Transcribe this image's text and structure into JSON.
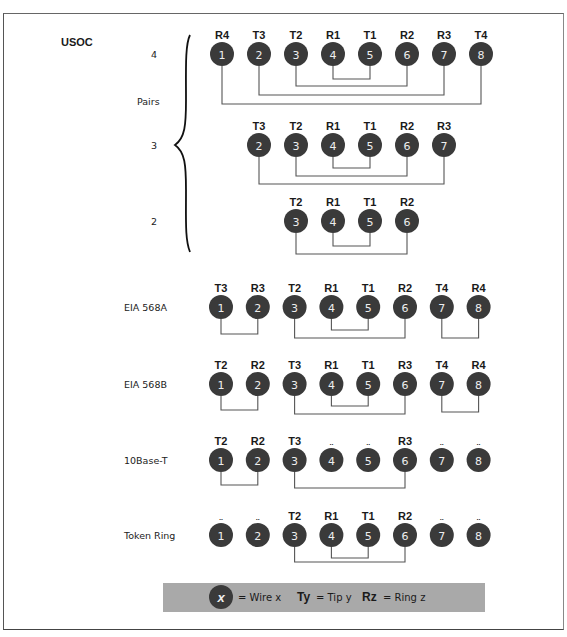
{
  "title": "USOC",
  "usoc_group": {
    "pairs_label": "Pairs",
    "pair_counts": [
      "4",
      "3",
      "2"
    ]
  },
  "pin_color": "#3a3a3a",
  "pin_text_color": "#eeeeee",
  "wire_color": "#555555",
  "legend_bg": "#a9a9a9",
  "unused_marker": "..",
  "rows": [
    {
      "id": "usoc-4",
      "label": "4",
      "cy": 54,
      "pins": [
        {
          "n": "1",
          "tag": "R4"
        },
        {
          "n": "2",
          "tag": "T3"
        },
        {
          "n": "3",
          "tag": "T2"
        },
        {
          "n": "4",
          "tag": "R1"
        },
        {
          "n": "5",
          "tag": "T1"
        },
        {
          "n": "6",
          "tag": "R2"
        },
        {
          "n": "7",
          "tag": "R3"
        },
        {
          "n": "8",
          "tag": "T4"
        }
      ],
      "pairs": [
        [
          4,
          5,
          79
        ],
        [
          3,
          6,
          86
        ],
        [
          2,
          7,
          95
        ],
        [
          1,
          8,
          104
        ]
      ]
    },
    {
      "id": "usoc-3",
      "label": "3",
      "cy": 145,
      "pins": [
        {
          "n": "2",
          "tag": "T3"
        },
        {
          "n": "3",
          "tag": "T2"
        },
        {
          "n": "4",
          "tag": "R1"
        },
        {
          "n": "5",
          "tag": "T1"
        },
        {
          "n": "6",
          "tag": "R2"
        },
        {
          "n": "7",
          "tag": "R3"
        }
      ],
      "pairs": [
        [
          4,
          5,
          168
        ],
        [
          3,
          6,
          176
        ],
        [
          2,
          7,
          184
        ]
      ]
    },
    {
      "id": "usoc-2",
      "label": "2",
      "cy": 221,
      "pins": [
        {
          "n": "3",
          "tag": "T2"
        },
        {
          "n": "4",
          "tag": "R1"
        },
        {
          "n": "5",
          "tag": "T1"
        },
        {
          "n": "6",
          "tag": "R2"
        }
      ],
      "pairs": [
        [
          4,
          5,
          246
        ],
        [
          3,
          6,
          254
        ]
      ]
    },
    {
      "id": "eia-568a",
      "label": "EIA 568A",
      "cy": 307,
      "pins": [
        {
          "n": "1",
          "tag": "T3"
        },
        {
          "n": "2",
          "tag": "R3"
        },
        {
          "n": "3",
          "tag": "T2"
        },
        {
          "n": "4",
          "tag": "R1"
        },
        {
          "n": "5",
          "tag": "T1"
        },
        {
          "n": "6",
          "tag": "R2"
        },
        {
          "n": "7",
          "tag": "T4"
        },
        {
          "n": "8",
          "tag": "R4"
        }
      ],
      "pairs": [
        [
          1,
          2,
          334
        ],
        [
          4,
          5,
          330
        ],
        [
          3,
          6,
          338
        ],
        [
          7,
          8,
          338
        ]
      ]
    },
    {
      "id": "eia-568b",
      "label": "EIA 568B",
      "cy": 384,
      "pins": [
        {
          "n": "1",
          "tag": "T2"
        },
        {
          "n": "2",
          "tag": "R2"
        },
        {
          "n": "3",
          "tag": "T3"
        },
        {
          "n": "4",
          "tag": "R1"
        },
        {
          "n": "5",
          "tag": "T1"
        },
        {
          "n": "6",
          "tag": "R3"
        },
        {
          "n": "7",
          "tag": "T4"
        },
        {
          "n": "8",
          "tag": "R4"
        }
      ],
      "pairs": [
        [
          1,
          2,
          410
        ],
        [
          4,
          5,
          406
        ],
        [
          3,
          6,
          414
        ],
        [
          7,
          8,
          412
        ]
      ]
    },
    {
      "id": "10base-t",
      "label": "10Base-T",
      "cy": 460,
      "pins": [
        {
          "n": "1",
          "tag": "T2"
        },
        {
          "n": "2",
          "tag": "R2"
        },
        {
          "n": "3",
          "tag": "T3"
        },
        {
          "n": "4",
          "tag": ".."
        },
        {
          "n": "5",
          "tag": ".."
        },
        {
          "n": "6",
          "tag": "R3"
        },
        {
          "n": "7",
          "tag": ".."
        },
        {
          "n": "8",
          "tag": ".."
        }
      ],
      "pairs": [
        [
          1,
          2,
          485
        ],
        [
          3,
          6,
          488
        ]
      ]
    },
    {
      "id": "token-ring",
      "label": "Token Ring",
      "cy": 535,
      "pins": [
        {
          "n": "1",
          "tag": ".."
        },
        {
          "n": "2",
          "tag": ".."
        },
        {
          "n": "3",
          "tag": "T2"
        },
        {
          "n": "4",
          "tag": "R1"
        },
        {
          "n": "5",
          "tag": "T1"
        },
        {
          "n": "6",
          "tag": "R2"
        },
        {
          "n": "7",
          "tag": ".."
        },
        {
          "n": "8",
          "tag": ".."
        }
      ],
      "pairs": [
        [
          4,
          5,
          558
        ],
        [
          3,
          6,
          562
        ]
      ]
    }
  ],
  "legend": {
    "circle_glyph": "x",
    "wire": "= Wire x",
    "tip_bold": "Ty",
    "tip": "= Tip y",
    "ring_bold": "Rz",
    "ring": "= Ring z"
  }
}
